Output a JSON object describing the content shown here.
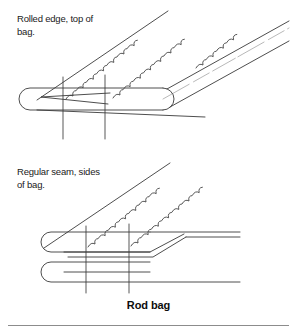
{
  "figure": {
    "caption": "Rod bag",
    "annotations": {
      "top_panel_label": "Rolled edge, top of\nbag.",
      "bottom_panel_label": "Regular seam, sides\nof bag."
    },
    "colors": {
      "background": "#ffffff",
      "line": "#3a3a3a",
      "line_light": "#9a9a9a",
      "text": "#1a1a1a",
      "rule": "#8c8c8c"
    }
  }
}
